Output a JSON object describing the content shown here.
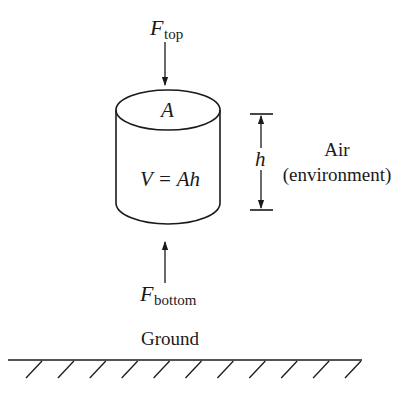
{
  "diagram": {
    "type": "free-body diagram of a cylindrical air parcel",
    "colors": {
      "ink": "#1a1a1a",
      "background": "#ffffff"
    },
    "forces": {
      "top": {
        "symbol": "F",
        "subscript": "top",
        "direction": "down"
      },
      "bottom": {
        "symbol": "F",
        "subscript": "bottom",
        "direction": "up"
      }
    },
    "cylinder": {
      "area_label": "A",
      "volume_label": "V = Ah"
    },
    "height_dimension": {
      "label": "h"
    },
    "environment": {
      "line1": "Air",
      "line2": "(environment)"
    },
    "ground": {
      "label": "Ground",
      "hatch_count": 11
    }
  }
}
